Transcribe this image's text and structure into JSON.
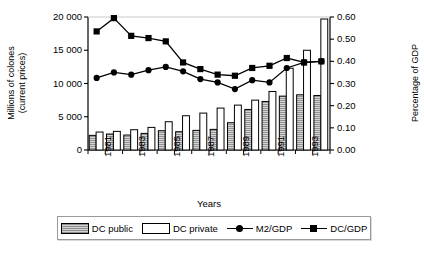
{
  "chart_data": {
    "type": "bar",
    "title": "",
    "xlabel": "Years",
    "ylabel": "Millions of colones (current prices)",
    "ylabel_right": "Percentage of GDP",
    "categories": [
      "1981",
      "1982",
      "1983",
      "1984",
      "1985",
      "1986",
      "1987",
      "1988",
      "1989",
      "1990",
      "1991",
      "1992",
      "1993",
      "1994"
    ],
    "xtick_labels": [
      "1981",
      "1983",
      "1985",
      "1987",
      "1989",
      "1991",
      "1993"
    ],
    "yticks_left": [
      "0",
      "5 000",
      "10 000",
      "15 000",
      "20 000"
    ],
    "yticks_right": [
      "0.00",
      "0.10",
      "0.20",
      "0.30",
      "0.40",
      "0.50",
      "0.60"
    ],
    "ylim": [
      0,
      20000
    ],
    "ylim_right": [
      0.0,
      0.6
    ],
    "grid": false,
    "legend_position": "bottom",
    "series": [
      {
        "name": "DC public",
        "kind": "bar",
        "axis": "left",
        "color": "#bdbdbd",
        "values": [
          2200,
          2400,
          2250,
          2500,
          2900,
          2750,
          2950,
          3100,
          4100,
          6100,
          7300,
          8100,
          8300,
          8200
        ]
      },
      {
        "name": "DC private",
        "kind": "bar",
        "axis": "left",
        "color": "#ffffff",
        "values": [
          2700,
          2800,
          3050,
          3400,
          4250,
          5150,
          5550,
          6300,
          6750,
          7500,
          8800,
          12300,
          15000,
          19700
        ]
      },
      {
        "name": "M2/GDP",
        "kind": "line",
        "axis": "right",
        "marker": "circle",
        "color": "#000000",
        "values": [
          0.325,
          0.35,
          0.34,
          0.36,
          0.375,
          0.355,
          0.32,
          0.305,
          0.275,
          0.315,
          0.305,
          0.37,
          0.395,
          0.4
        ]
      },
      {
        "name": "DC/GDP",
        "kind": "line",
        "axis": "right",
        "marker": "square",
        "color": "#000000",
        "values": [
          0.535,
          0.595,
          0.515,
          0.505,
          0.49,
          0.395,
          0.365,
          0.34,
          0.335,
          0.37,
          0.38,
          0.415,
          0.395,
          0.4
        ]
      }
    ]
  },
  "axes": {
    "left_title_line1": "Millions of colones",
    "left_title_line2": "(current prices)",
    "right_title": "Percentage of GDP",
    "x_title": "Years"
  },
  "legend": {
    "items": [
      {
        "label": "DC public",
        "type": "swatch-hatched"
      },
      {
        "label": "DC private",
        "type": "swatch-white"
      },
      {
        "label": "M2/GDP",
        "type": "line-circle"
      },
      {
        "label": "DC/GDP",
        "type": "line-square"
      }
    ]
  }
}
